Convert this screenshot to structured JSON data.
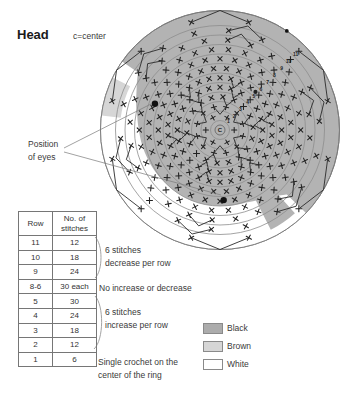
{
  "header": {
    "title": "Head",
    "note": "c=center"
  },
  "eyes_label": {
    "line1": "Position",
    "line2": "of eyes"
  },
  "table": {
    "col1_header": "Row",
    "col2_header": "No. of\nstitches",
    "rows": [
      {
        "row": "11",
        "stitches": "12"
      },
      {
        "row": "10",
        "stitches": "18"
      },
      {
        "row": "9",
        "stitches": "24"
      },
      {
        "row": "8-6",
        "stitches": "30 each"
      },
      {
        "row": "5",
        "stitches": "30"
      },
      {
        "row": "4",
        "stitches": "24"
      },
      {
        "row": "3",
        "stitches": "18"
      },
      {
        "row": "2",
        "stitches": "12"
      },
      {
        "row": "1",
        "stitches": "6"
      }
    ]
  },
  "annotations": {
    "decrease": "6 stitches\ndecrease per row",
    "even": "No increase or decrease",
    "increase": "6 stitches\nincrease per row",
    "row1": "Single crochet on the\ncenter of the ring"
  },
  "legend": {
    "items": [
      {
        "label": "Black",
        "color": "#acacac"
      },
      {
        "label": "Brown",
        "color": "#d6d6d6"
      },
      {
        "label": "White",
        "color": "#ffffff"
      }
    ]
  },
  "diagram": {
    "center_label": "C",
    "ring_numbers": [
      "1",
      "2",
      "3",
      "4",
      "5",
      "6",
      "7",
      "8",
      "9",
      "10",
      "11"
    ],
    "rings": [
      {
        "row": 1,
        "stitches": 6,
        "shaping": "base"
      },
      {
        "row": 2,
        "stitches": 12,
        "shaping": "increase"
      },
      {
        "row": 3,
        "stitches": 18,
        "shaping": "increase"
      },
      {
        "row": 4,
        "stitches": 24,
        "shaping": "increase"
      },
      {
        "row": 5,
        "stitches": 30,
        "shaping": "increase"
      },
      {
        "row": 6,
        "stitches": 30,
        "shaping": "even"
      },
      {
        "row": 7,
        "stitches": 30,
        "shaping": "even"
      },
      {
        "row": 8,
        "stitches": 30,
        "shaping": "even"
      },
      {
        "row": 9,
        "stitches": 24,
        "shaping": "decrease"
      },
      {
        "row": 10,
        "stitches": 18,
        "shaping": "decrease"
      },
      {
        "row": 11,
        "stitches": 12,
        "shaping": "decrease"
      }
    ],
    "eyes": [
      {
        "ring": 7,
        "angle_deg": 158
      },
      {
        "ring": 7,
        "angle_deg": 273
      }
    ],
    "colors": {
      "black": "#b3b3b3",
      "brown": "#d6d6d6",
      "white": "#ffffff",
      "stitch": "#222222",
      "ring_line": "#8d8d8d",
      "edge": "#7d7d7d"
    }
  }
}
